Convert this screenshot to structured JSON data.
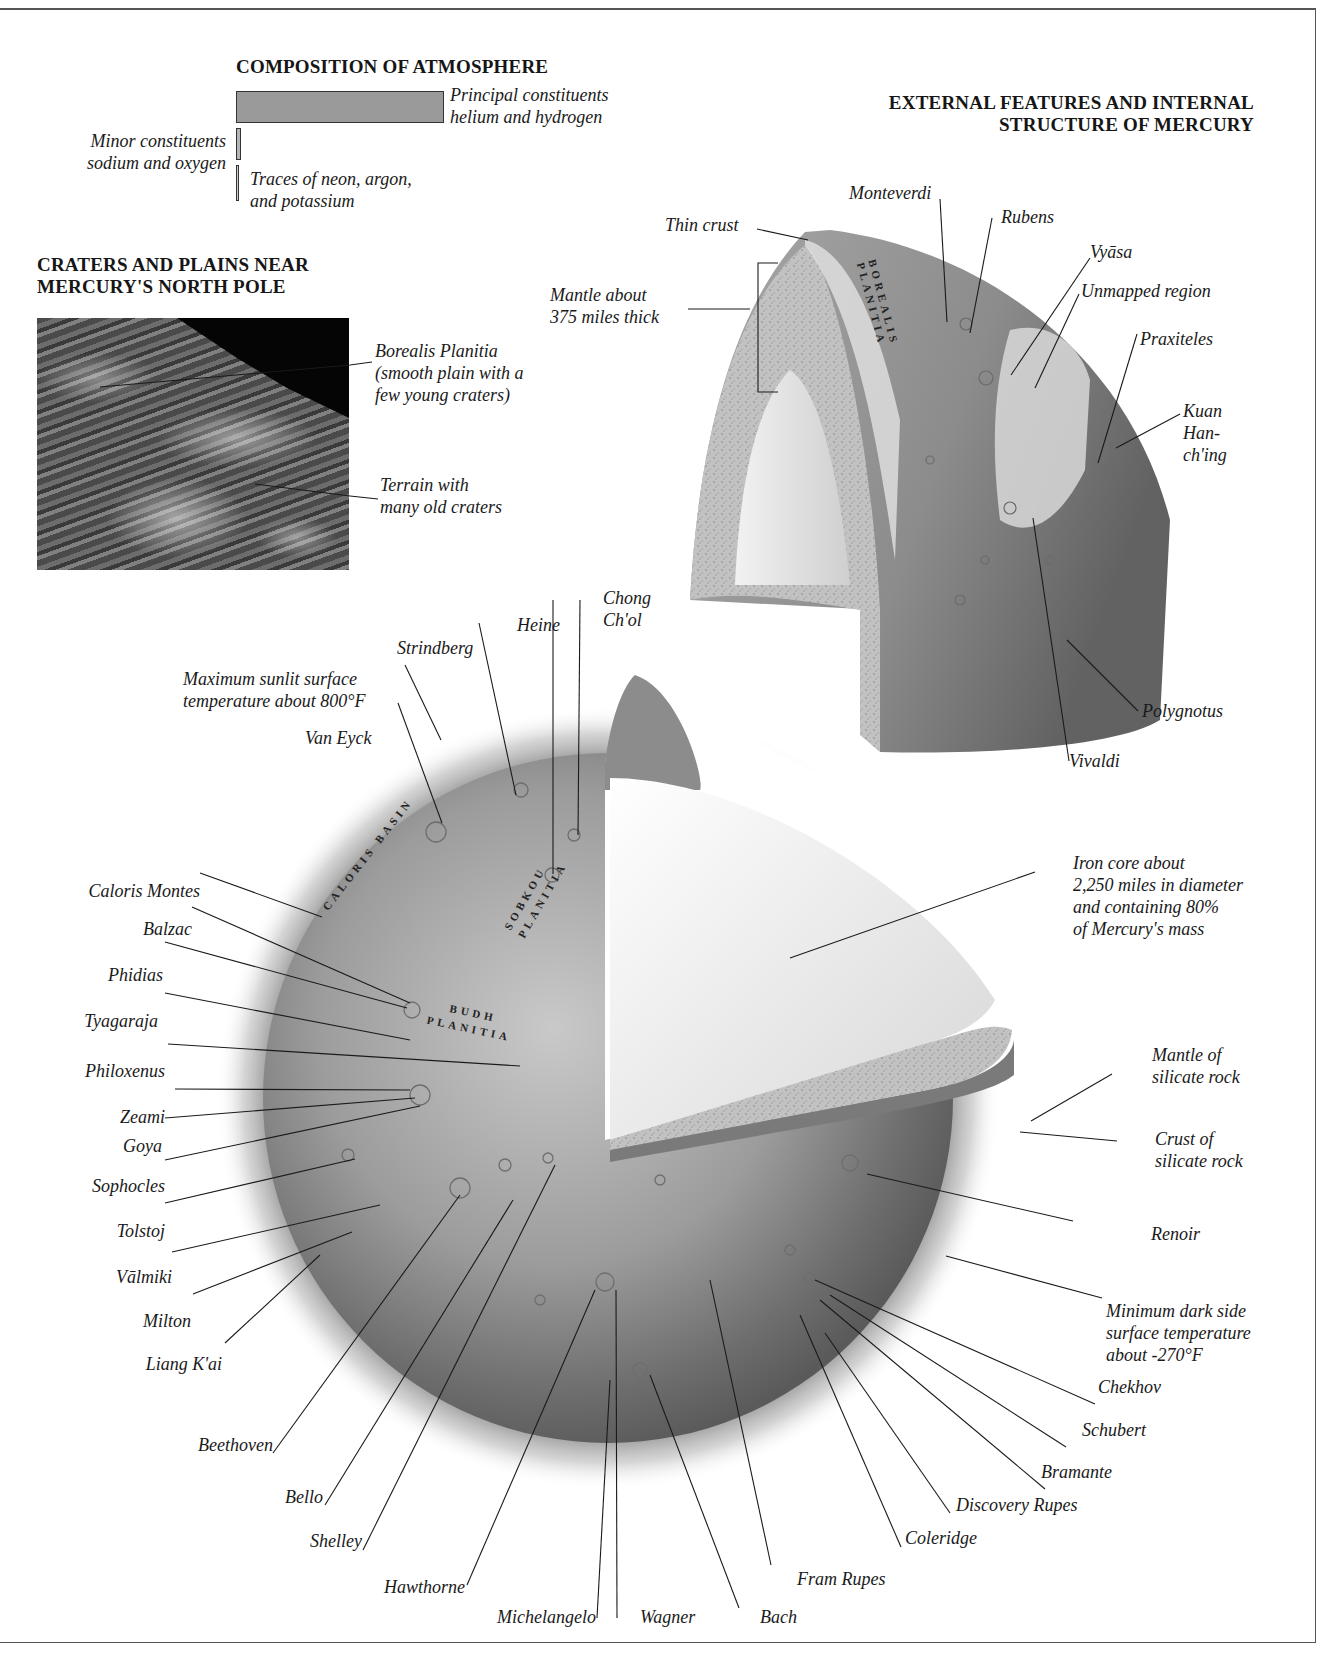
{
  "frame": {
    "border_color": "#555555"
  },
  "atmosphere": {
    "title": "COMPOSITION OF ATMOSPHERE",
    "bars": [
      {
        "name": "principal",
        "label_line1": "Principal constituents",
        "label_line2": "helium and hydrogen",
        "fill": "#9a9a9a"
      },
      {
        "name": "minor",
        "label_line1": "Minor constituents",
        "label_line2": "sodium and oxygen",
        "fill": "#b5b5b5"
      },
      {
        "name": "traces",
        "label_line1": "Traces of neon, argon,",
        "label_line2": "and potassium",
        "fill": "#cfcfcf"
      }
    ]
  },
  "north_pole": {
    "title_line1": "CRATERS AND PLAINS NEAR",
    "title_line2": "MERCURY'S NORTH POLE",
    "callouts": [
      {
        "lines": [
          "Borealis Planitia",
          "(smooth plain with a",
          "few young craters)"
        ]
      },
      {
        "lines": [
          "Terrain with",
          "many old craters"
        ]
      }
    ]
  },
  "cutaway": {
    "title_line1": "EXTERNAL FEATURES AND INTERNAL",
    "title_line2": "STRUCTURE OF MERCURY",
    "map_label_line1": "BOREALIS",
    "map_label_line2": "PLANITIA",
    "labels": {
      "thin_crust": "Thin crust",
      "mantle_line1": "Mantle about",
      "mantle_line2": "375 miles thick",
      "monteverdi": "Monteverdi",
      "rubens": "Rubens",
      "vyasa": "Vyāsa",
      "unmapped": "Unmapped region",
      "praxiteles": "Praxiteles",
      "kuan_line1": "Kuan",
      "kuan_line2": "Han-",
      "kuan_line3": "ch'ing",
      "polygnotus": "Polygnotus",
      "vivaldi": "Vivaldi"
    }
  },
  "sphere": {
    "map_labels": {
      "caloris": "CALORIS BASIN",
      "sobkou_line1": "SOBKOU",
      "sobkou_line2": "PLANITIA",
      "budh_line1": "BUDH",
      "budh_line2": "PLANITIA"
    },
    "top_labels": {
      "max_temp_line1": "Maximum sunlit surface",
      "max_temp_line2": "temperature about 800°F",
      "van_eyck": "Van Eyck",
      "strindberg": "Strindberg",
      "heine": "Heine",
      "chong_line1": "Chong",
      "chong_line2": "Ch'ol"
    },
    "left_labels": [
      "Caloris Montes",
      "Balzac",
      "Phidias",
      "Tyagaraja",
      "Philoxenus",
      "Zeami",
      "Goya",
      "Sophocles",
      "Tolstoj",
      "Vālmiki",
      "Milton",
      "Liang K'ai",
      "Beethoven",
      "Bello",
      "Shelley",
      "Hawthorne"
    ],
    "bottom_labels": [
      "Michelangelo",
      "Wagner",
      "Bach",
      "Fram Rupes",
      "Coleridge",
      "Discovery Rupes",
      "Bramante",
      "Schubert",
      "Chekhov"
    ],
    "right_labels": {
      "core_line1": "Iron core about",
      "core_line2": "2,250 miles in diameter",
      "core_line3": "and containing 80%",
      "core_line4": "of Mercury's mass",
      "mantle_line1": "Mantle of",
      "mantle_line2": "silicate rock",
      "crust_line1": "Crust of",
      "crust_line2": "silicate rock",
      "renoir": "Renoir",
      "min_temp_line1": "Minimum dark side",
      "min_temp_line2": "surface temperature",
      "min_temp_line3": "about -270°F"
    }
  }
}
